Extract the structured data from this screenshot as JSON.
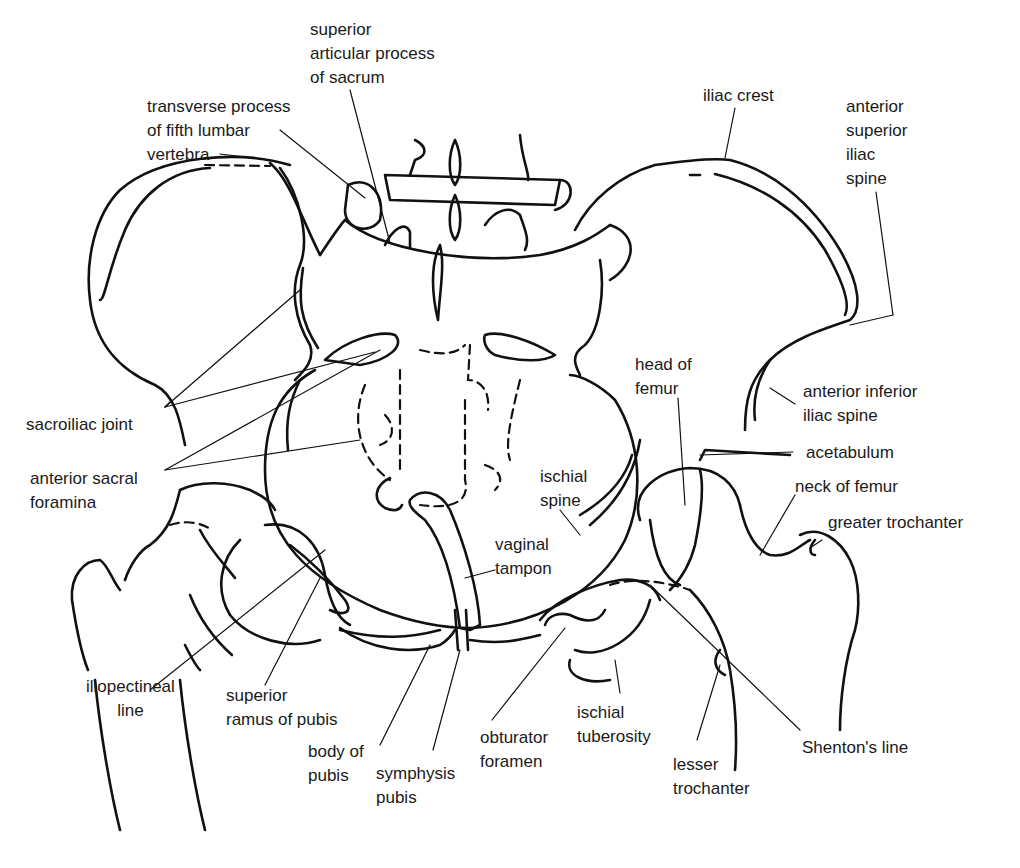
{
  "diagram": {
    "line_color": "#111111",
    "background": "#ffffff"
  },
  "labels": {
    "superior_articular_process": "superior\narticular process\nof sacrum",
    "transverse_process": "transverse process\nof fifth lumbar\nvertebra",
    "iliac_crest": "iliac crest",
    "asis": "anterior\nsuperior\niliac\nspine",
    "sacroiliac_joint": "sacroiliac joint",
    "anterior_sacral_foramina": "anterior sacral\nforamina",
    "head_of_femur": "head of\nfemur",
    "aiis": "anterior inferior\niliac spine",
    "acetabulum": "acetabulum",
    "neck_of_femur": "neck of femur",
    "greater_trochanter": "greater trochanter",
    "ischial_spine": "ischial\nspine",
    "vaginal_tampon": "vaginal\ntampon",
    "iliopectineal_line": "iliopectineal\nline",
    "superior_ramus": "superior\nramus of pubis",
    "body_of_pubis": "body of\npubis",
    "symphysis_pubis": "symphysis\npubis",
    "obturator_foramen": "obturator\nforamen",
    "ischial_tuberosity": "ischial\ntuberosity",
    "lesser_trochanter": "lesser\ntrochanter",
    "shentons_line": "Shenton's line"
  }
}
